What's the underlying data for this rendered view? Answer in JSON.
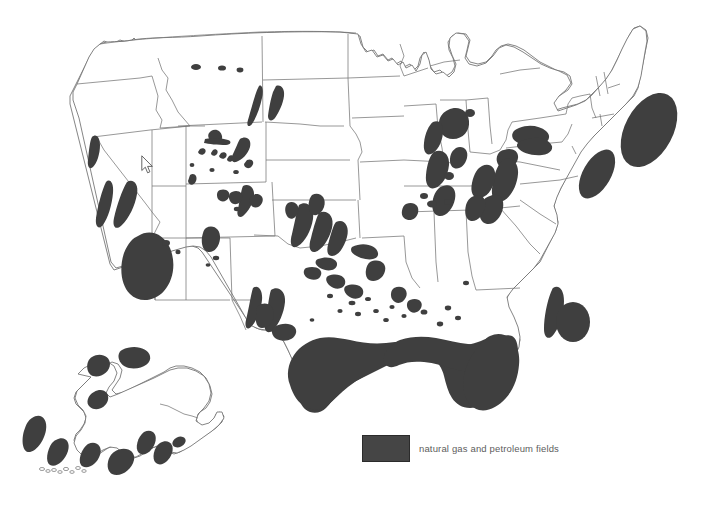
{
  "map": {
    "title": "United States natural gas and petroleum fields",
    "projection_note": "conterminous United States with Alaska inset",
    "background_color": "#ffffff",
    "border_color": "#6b6b6b",
    "field_fill_color": "#3f3f3f",
    "width": 702,
    "height": 505
  },
  "legend": {
    "swatch_color": "#454545",
    "swatch_border_color": "#2b2b2b",
    "label": "natural gas and petroleum fields",
    "label_color": "#5d5d5d"
  },
  "cursor": {
    "visible": true,
    "x": 141,
    "y": 155
  },
  "chart_data": {
    "type": "map",
    "title": "natural gas and petroleum fields",
    "legend_entries": [
      {
        "label": "natural gas and petroleum fields",
        "color": "#3f3f3f"
      }
    ],
    "regions": [
      {
        "name": "Gulf of Mexico coastal and offshore band",
        "states": [
          "Texas",
          "Louisiana",
          "Mississippi",
          "Alabama",
          "Florida"
        ],
        "prominence": "largest"
      },
      {
        "name": "Georges Bank offshore Atlantic basin",
        "states": [
          "offshore New England"
        ],
        "prominence": "large"
      },
      {
        "name": "Baltimore Canyon offshore basin",
        "states": [
          "offshore Mid-Atlantic"
        ],
        "prominence": "medium"
      },
      {
        "name": "Southeast Georgia Embayment offshore basin",
        "states": [
          "offshore Carolinas"
        ],
        "prominence": "medium"
      },
      {
        "name": "Blake Plateau offshore basin",
        "states": [
          "offshore Georgia"
        ],
        "prominence": "medium"
      },
      {
        "name": "San Joaquin Valley oil fields",
        "states": [
          "California"
        ],
        "prominence": "large"
      },
      {
        "name": "Coastal California oil fields",
        "states": [
          "California"
        ],
        "prominence": "medium"
      },
      {
        "name": "Sacramento Valley gas fields",
        "states": [
          "California"
        ],
        "prominence": "small"
      },
      {
        "name": "Permian Basin",
        "states": [
          "Texas",
          "New Mexico"
        ],
        "prominence": "large"
      },
      {
        "name": "Anadarko Basin / midcontinent",
        "states": [
          "Oklahoma",
          "Kansas",
          "Texas"
        ],
        "prominence": "large"
      },
      {
        "name": "San Juan Basin",
        "states": [
          "New Mexico",
          "Colorado"
        ],
        "prominence": "medium"
      },
      {
        "name": "Green River and Wind River basins",
        "states": [
          "Wyoming"
        ],
        "prominence": "scattered"
      },
      {
        "name": "Williston Basin",
        "states": [
          "North Dakota",
          "Montana"
        ],
        "prominence": "medium"
      },
      {
        "name": "Michigan Basin",
        "states": [
          "Michigan"
        ],
        "prominence": "medium"
      },
      {
        "name": "Illinois Basin",
        "states": [
          "Illinois",
          "Indiana",
          "Kentucky"
        ],
        "prominence": "medium"
      },
      {
        "name": "Appalachian Basin",
        "states": [
          "Pennsylvania",
          "Ohio",
          "West Virginia",
          "New York"
        ],
        "prominence": "large"
      },
      {
        "name": "Alaska North Slope and offshore basins",
        "states": [
          "Alaska"
        ],
        "prominence": "large"
      },
      {
        "name": "Cook Inlet and Aleutian offshore basins",
        "states": [
          "Alaska"
        ],
        "prominence": "medium"
      }
    ]
  }
}
